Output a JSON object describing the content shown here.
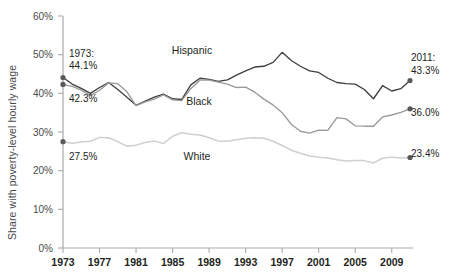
{
  "chart_data": {
    "type": "line",
    "title": "",
    "xlabel": "",
    "ylabel": "Share with poverty-level hourly wage",
    "xlim": [
      1973,
      2011
    ],
    "ylim": [
      0,
      60
    ],
    "grid": false,
    "legend_position": "inline-series-labels",
    "ytick_labels": [
      "0%",
      "10%",
      "20%",
      "30%",
      "40%",
      "50%",
      "60%"
    ],
    "ytick_values": [
      0,
      10,
      20,
      30,
      40,
      50,
      60
    ],
    "xtick_labels": [
      "1973",
      "1977",
      "1981",
      "1985",
      "1989",
      "1993",
      "1997",
      "2001",
      "2005",
      "2009"
    ],
    "xtick_values": [
      1973,
      1977,
      1981,
      1985,
      1989,
      1993,
      1997,
      2001,
      2005,
      2009
    ],
    "x": [
      1973,
      1974,
      1975,
      1976,
      1977,
      1978,
      1979,
      1980,
      1981,
      1982,
      1983,
      1984,
      1985,
      1986,
      1987,
      1988,
      1989,
      1990,
      1991,
      1992,
      1993,
      1994,
      1995,
      1996,
      1997,
      1998,
      1999,
      2000,
      2001,
      2002,
      2003,
      2004,
      2005,
      2006,
      2007,
      2008,
      2009,
      2010,
      2011
    ],
    "series": [
      {
        "name": "Hispanic",
        "color": "#3f3f3f",
        "start_label": "44.1%",
        "end_label": "43.3%",
        "values": [
          44.1,
          42.4,
          41.3,
          40.0,
          41.5,
          42.8,
          41.0,
          39.0,
          36.9,
          38.0,
          39.0,
          39.8,
          38.6,
          38.4,
          42.2,
          43.9,
          43.6,
          43.1,
          43.5,
          44.7,
          45.8,
          46.8,
          47.0,
          48.0,
          50.6,
          48.5,
          47.0,
          45.8,
          45.4,
          43.9,
          42.8,
          42.5,
          42.4,
          41.0,
          38.6,
          42.0,
          40.6,
          41.2,
          43.3
        ]
      },
      {
        "name": "Black",
        "color": "#9a9a9a",
        "start_label": "42.3%",
        "end_label": "36.0%",
        "values": [
          42.3,
          41.8,
          40.8,
          39.4,
          40.8,
          42.7,
          42.5,
          40.4,
          36.8,
          37.8,
          38.5,
          39.6,
          38.3,
          38.1,
          41.2,
          43.4,
          43.4,
          42.9,
          42.4,
          41.5,
          41.6,
          40.3,
          38.5,
          37.0,
          35.0,
          32.0,
          30.2,
          29.7,
          30.5,
          30.4,
          33.7,
          33.4,
          31.6,
          31.5,
          31.5,
          33.9,
          34.4,
          35.1,
          36.0
        ]
      },
      {
        "name": "White",
        "color": "#cfcfcf",
        "start_label": "27.5%",
        "end_label": "23.4%",
        "values": [
          27.5,
          27.1,
          27.4,
          27.6,
          28.6,
          28.5,
          27.5,
          26.3,
          26.6,
          27.3,
          27.7,
          27.0,
          28.9,
          29.8,
          29.4,
          29.2,
          28.5,
          27.7,
          27.6,
          28.0,
          28.4,
          28.5,
          28.4,
          27.6,
          26.5,
          25.3,
          24.5,
          23.8,
          23.5,
          23.3,
          22.8,
          22.5,
          22.6,
          22.6,
          22.0,
          23.2,
          23.5,
          23.3,
          23.4
        ]
      }
    ],
    "annotations": [
      {
        "name": "start-year-1973",
        "text": "1973:",
        "x": 69,
        "y": 57
      },
      {
        "name": "start-value-hispanic",
        "text": "44.1%",
        "x": 69,
        "y": 69
      },
      {
        "name": "start-value-black",
        "text": "42.3%",
        "x": 69,
        "y": 102
      },
      {
        "name": "start-value-white",
        "text": "27.5%",
        "x": 69,
        "y": 160
      },
      {
        "name": "end-year-2011",
        "text": "2011:",
        "x": 411,
        "y": 61
      },
      {
        "name": "end-value-hispanic",
        "text": "43.3%",
        "x": 411,
        "y": 74
      },
      {
        "name": "end-value-black",
        "text": "36.0%",
        "x": 411,
        "y": 116
      },
      {
        "name": "end-value-white",
        "text": "23.4%",
        "x": 411,
        "y": 157
      }
    ],
    "series_labels": [
      {
        "name": "series-label-hispanic",
        "text": "Hispanic",
        "x": 192,
        "y": 54
      },
      {
        "name": "series-label-black",
        "text": "Black",
        "x": 199,
        "y": 105
      },
      {
        "name": "series-label-white",
        "text": "White",
        "x": 197,
        "y": 160
      }
    ]
  }
}
